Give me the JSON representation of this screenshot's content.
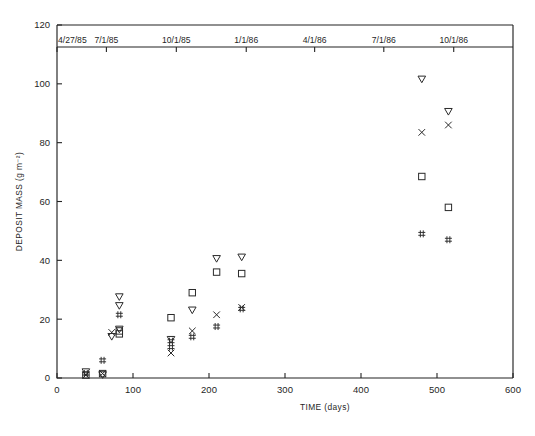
{
  "chart_data": {
    "type": "scatter",
    "title": "",
    "xlabel": "TIME (days)",
    "ylabel": "DEPOSIT MASS (g m⁻²)",
    "xlim": [
      0,
      600
    ],
    "ylim": [
      0,
      120
    ],
    "xticks": [
      0,
      100,
      200,
      300,
      400,
      500,
      600
    ],
    "yticks": [
      0,
      20,
      40,
      60,
      80,
      100,
      120
    ],
    "grid": false,
    "legend": "none",
    "secondary_axis": {
      "position": "top",
      "label": "",
      "ticks": [
        {
          "value": 0,
          "label": "4/27/85"
        },
        {
          "value": 65,
          "label": "7/1/85"
        },
        {
          "value": 157,
          "label": "10/1/85"
        },
        {
          "value": 249,
          "label": "1/1/86"
        },
        {
          "value": 339,
          "label": "4/1/86"
        },
        {
          "value": 430,
          "label": "7/1/86"
        },
        {
          "value": 522,
          "label": "10/1/86"
        }
      ]
    },
    "series": [
      {
        "name": "triangle-down",
        "marker": "triangle-down",
        "points": [
          {
            "x": 38,
            "y": 2.0
          },
          {
            "x": 60,
            "y": 1.0
          },
          {
            "x": 72,
            "y": 14.0
          },
          {
            "x": 82,
            "y": 27.5
          },
          {
            "x": 82,
            "y": 24.5
          },
          {
            "x": 82,
            "y": 16.5
          },
          {
            "x": 150,
            "y": 13.0
          },
          {
            "x": 178,
            "y": 23.0
          },
          {
            "x": 210,
            "y": 40.5
          },
          {
            "x": 243,
            "y": 41.0
          },
          {
            "x": 480,
            "y": 101.5
          },
          {
            "x": 515,
            "y": 90.5
          }
        ]
      },
      {
        "name": "square",
        "marker": "square",
        "points": [
          {
            "x": 38,
            "y": 1.0
          },
          {
            "x": 60,
            "y": 1.5
          },
          {
            "x": 82,
            "y": 16.0
          },
          {
            "x": 82,
            "y": 15.0
          },
          {
            "x": 150,
            "y": 20.5
          },
          {
            "x": 178,
            "y": 29.0
          },
          {
            "x": 210,
            "y": 36.0
          },
          {
            "x": 243,
            "y": 35.5
          },
          {
            "x": 480,
            "y": 68.5
          },
          {
            "x": 515,
            "y": 58.0
          }
        ]
      },
      {
        "name": "cross-x",
        "marker": "x",
        "points": [
          {
            "x": 38,
            "y": 1.0
          },
          {
            "x": 60,
            "y": 1.5
          },
          {
            "x": 72,
            "y": 15.5
          },
          {
            "x": 150,
            "y": 8.5
          },
          {
            "x": 178,
            "y": 16.0
          },
          {
            "x": 210,
            "y": 21.5
          },
          {
            "x": 243,
            "y": 24.0
          },
          {
            "x": 480,
            "y": 83.5
          },
          {
            "x": 515,
            "y": 86.0
          }
        ]
      },
      {
        "name": "hash",
        "marker": "hash",
        "points": [
          {
            "x": 38,
            "y": 1.5
          },
          {
            "x": 60,
            "y": 6.0
          },
          {
            "x": 82,
            "y": 21.5
          },
          {
            "x": 150,
            "y": 10.5
          },
          {
            "x": 150,
            "y": 12.5
          },
          {
            "x": 178,
            "y": 14.0
          },
          {
            "x": 210,
            "y": 17.5
          },
          {
            "x": 243,
            "y": 23.5
          },
          {
            "x": 480,
            "y": 49.0
          },
          {
            "x": 515,
            "y": 47.0
          }
        ]
      }
    ]
  }
}
